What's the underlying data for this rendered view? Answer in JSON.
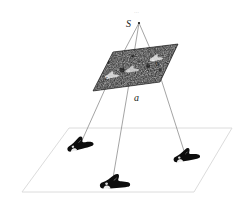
{
  "figure": {
    "background_color": "#ffffff"
  },
  "labels": {
    "apex": "S",
    "plane_label": "a",
    "plane_point_left": "c",
    "plane_point_right": "b",
    "top_tick": "…"
  },
  "colors": {
    "ray_line": "#8a8a8a",
    "ground_outline": "#d8d8d8",
    "image_plane_fill": "#1e1e1e",
    "object_fill": "#0d0d0d",
    "text": "#1a1a1a",
    "faint_text": "#b8b8b8"
  },
  "geometry": {
    "apex_point": {
      "x": 139,
      "y": 23
    },
    "image_plane_corners": [
      {
        "x": 113,
        "y": 52
      },
      {
        "x": 178,
        "y": 44
      },
      {
        "x": 160,
        "y": 82
      },
      {
        "x": 93,
        "y": 91
      }
    ],
    "ground_plane_corners": [
      {
        "x": 69,
        "y": 128
      },
      {
        "x": 232,
        "y": 128
      },
      {
        "x": 194,
        "y": 192
      },
      {
        "x": 22,
        "y": 192
      }
    ],
    "projection_points": [
      {
        "name": "left",
        "x": 110,
        "y": 78
      },
      {
        "name": "center",
        "x": 131,
        "y": 72
      },
      {
        "name": "right",
        "x": 155,
        "y": 60
      }
    ],
    "objects": [
      {
        "name": "shoe-left",
        "x": 78,
        "y": 147,
        "rotation": -18,
        "scale": 1.0
      },
      {
        "name": "shoe-center",
        "x": 114,
        "y": 182,
        "rotation": -6,
        "scale": 1.15
      },
      {
        "name": "shoe-right",
        "x": 186,
        "y": 159,
        "rotation": -10,
        "scale": 1.0
      }
    ]
  },
  "annotations": {
    "apex_label_position": {
      "x": 126,
      "y": 26
    },
    "plane_label_position": {
      "x": 136,
      "y": 100
    },
    "top_tick_position": {
      "x": 137,
      "y": 12
    }
  }
}
